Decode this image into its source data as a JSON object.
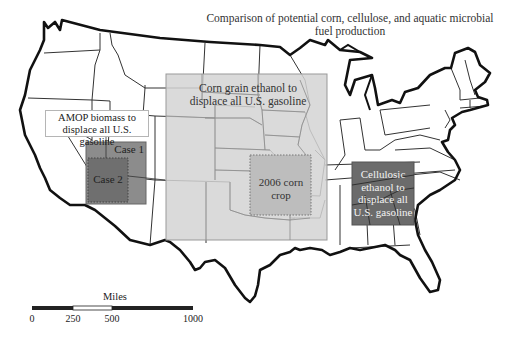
{
  "title": "Comparison of potential corn, cellulose, and aquatic microbial fuel production",
  "regions": {
    "corn_grain": {
      "label": "Corn grain ethanol to displace all U.S. gasoline",
      "label_line1": "Corn grain ethanol to",
      "label_line2": "displace all U.S. gasoline",
      "fill": "#d3d3d3",
      "box": {
        "x": 166,
        "y": 74,
        "w": 161,
        "h": 166
      }
    },
    "corn_2006": {
      "label": "2006 corn crop",
      "label_line1": "2006 corn",
      "label_line2": "crop",
      "fill": "#bfbfbf",
      "border": "dotted",
      "box": {
        "x": 250,
        "y": 155,
        "w": 61,
        "h": 60
      }
    },
    "amop": {
      "label": "AMOP biomass to displace all U.S. gasoline",
      "label_line1": "AMOP biomass to",
      "label_line2": "displace all U.S. gasoline",
      "case1": {
        "label": "Case 1",
        "fill": "#8c8c8c",
        "box": {
          "x": 86,
          "y": 142,
          "w": 60,
          "h": 62
        }
      },
      "case2": {
        "label": "Case 2",
        "fill": "#6e6e6e",
        "border": "dotted",
        "box": {
          "x": 88,
          "y": 158,
          "w": 40,
          "h": 44
        }
      }
    },
    "cellulosic": {
      "label": "Cellulosic ethanol to displace all U.S. gasoline",
      "label_line1": "Cellulosic",
      "label_line2": "ethanol to",
      "label_line3": "displace all",
      "label_line4": "U.S. gasoline",
      "fill": "#6b6b6b",
      "box": {
        "x": 352,
        "y": 162,
        "w": 62,
        "h": 63
      }
    }
  },
  "scale_bar": {
    "unit": "Miles",
    "ticks": [
      "0",
      "250",
      "500",
      "1000"
    ]
  }
}
